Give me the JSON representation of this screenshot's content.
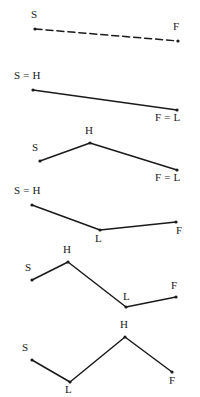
{
  "figure": {
    "width": 200,
    "height": 397,
    "background": "#ffffff",
    "stroke_color": "#1a1a1a",
    "point_color": "#1a1a1a",
    "diagram_count": 6
  },
  "diagrams": [
    {
      "id": "diagram-1",
      "style": "dashed",
      "points": [
        {
          "label": "S",
          "x": 35,
          "y": 29,
          "label_x": 31,
          "label_y": 9
        },
        {
          "label": "F",
          "x": 178,
          "y": 41,
          "label_x": 173,
          "label_y": 21
        }
      ]
    },
    {
      "id": "diagram-2",
      "style": "solid",
      "points": [
        {
          "label": "S = H",
          "x": 33,
          "y": 90,
          "label_x": 14,
          "label_y": 70
        },
        {
          "label": "F = L",
          "x": 177,
          "y": 110,
          "label_x": 155,
          "label_y": 112
        }
      ]
    },
    {
      "id": "diagram-3",
      "style": "solid",
      "points": [
        {
          "label": "S",
          "x": 40,
          "y": 161,
          "label_x": 32,
          "label_y": 142
        },
        {
          "label": "H",
          "x": 90,
          "y": 143,
          "label_x": 85,
          "label_y": 125
        },
        {
          "label": "F = L",
          "x": 177,
          "y": 170,
          "label_x": 155,
          "label_y": 172
        }
      ]
    },
    {
      "id": "diagram-4",
      "style": "solid",
      "points": [
        {
          "label": "S = H",
          "x": 32,
          "y": 205,
          "label_x": 14,
          "label_y": 185
        },
        {
          "label": "L",
          "x": 100,
          "y": 230,
          "label_x": 95,
          "label_y": 233
        },
        {
          "label": "F",
          "x": 176,
          "y": 222,
          "label_x": 176,
          "label_y": 225
        }
      ]
    },
    {
      "id": "diagram-5",
      "style": "solid",
      "points": [
        {
          "label": "S",
          "x": 32,
          "y": 280,
          "label_x": 25,
          "label_y": 262
        },
        {
          "label": "H",
          "x": 68,
          "y": 262,
          "label_x": 63,
          "label_y": 244
        },
        {
          "label": "L",
          "x": 126,
          "y": 307,
          "label_x": 123,
          "label_y": 291
        },
        {
          "label": "F",
          "x": 176,
          "y": 297,
          "label_x": 171,
          "label_y": 280
        }
      ]
    },
    {
      "id": "diagram-6",
      "style": "solid",
      "points": [
        {
          "label": "S",
          "x": 32,
          "y": 360,
          "label_x": 22,
          "label_y": 342
        },
        {
          "label": "L",
          "x": 70,
          "y": 382,
          "label_x": 65,
          "label_y": 384
        },
        {
          "label": "H",
          "x": 125,
          "y": 337,
          "label_x": 120,
          "label_y": 319
        },
        {
          "label": "F",
          "x": 172,
          "y": 372,
          "label_x": 169,
          "label_y": 375
        }
      ]
    }
  ]
}
